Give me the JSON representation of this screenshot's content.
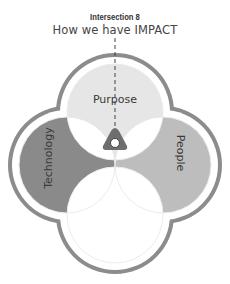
{
  "header": {
    "subtitle": "Intersection 8",
    "title": "How we have IMPACT"
  },
  "diagram": {
    "type": "four-circle-venn",
    "circles": [
      {
        "id": "purpose",
        "label": "Purpose",
        "position": "top",
        "fill": "#e6e6e6"
      },
      {
        "id": "technology",
        "label": "Technology",
        "position": "left",
        "fill": "#8a8a8a"
      },
      {
        "id": "people",
        "label": "People",
        "position": "right",
        "fill": "#bdbdbd"
      },
      {
        "id": "bottom",
        "label": "",
        "position": "bottom",
        "fill": "#ffffff"
      }
    ],
    "highlight": {
      "name": "intersection-marker",
      "intersection": "Purpose ∩ Technology ∩ People",
      "color": "#6e6e6e"
    },
    "outline_color": "#8c8c8c",
    "line_color": "#f0f0f0"
  }
}
